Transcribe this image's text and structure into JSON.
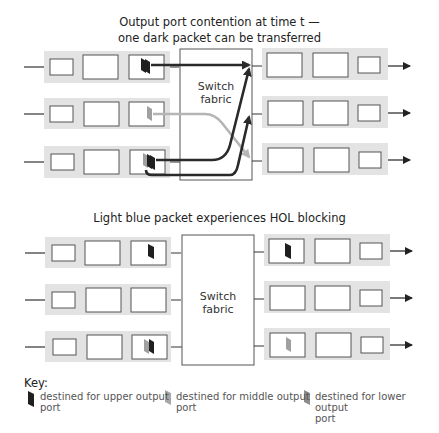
{
  "top": {
    "title_line1": "Output port contention at time t —",
    "title_line2": "one dark packet can be transferred",
    "fabric_line1": "Switch",
    "fabric_line2": "fabric"
  },
  "bottom": {
    "title": "Light blue packet experiences HOL blocking",
    "fabric_line1": "Switch",
    "fabric_line2": "fabric"
  },
  "key": {
    "heading": "Key:",
    "items": [
      {
        "label": "destined for upper output port",
        "line1": "destined for upper output",
        "line2": "port",
        "color": "#1f1f1f"
      },
      {
        "label": "destined for middle output port",
        "line1": "destined for middle output",
        "line2": "port",
        "color": "#a8a8a8"
      },
      {
        "label": "destined for lower output port",
        "line1": "destined for lower output",
        "line2": "port",
        "color": "#8c8c8c"
      }
    ]
  },
  "colors": {
    "band": "#e3e3e3",
    "box_border": "#555555",
    "dark_packet": "#1f1f1f",
    "light_packet": "#a0a0a0",
    "dark_path": "#2a2a2a",
    "light_path": "#b5b5b5"
  }
}
